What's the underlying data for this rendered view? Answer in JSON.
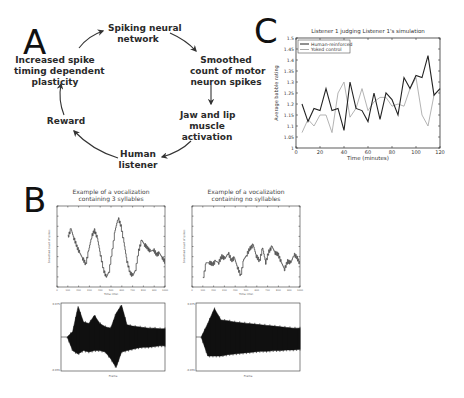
{
  "panels": {
    "a": {
      "letter": "A",
      "nodes": [
        {
          "id": "network",
          "lines": [
            "Spiking neural",
            "network"
          ]
        },
        {
          "id": "smoothed",
          "lines": [
            "Smoothed",
            "count of motor",
            "neuron spikes"
          ]
        },
        {
          "id": "jaw",
          "lines": [
            "Jaw and lip",
            "muscle",
            "activation"
          ]
        },
        {
          "id": "listener",
          "lines": [
            "Human",
            "listener"
          ]
        },
        {
          "id": "reward",
          "lines": [
            "Reward"
          ]
        },
        {
          "id": "stdp",
          "lines": [
            "Increased spike",
            "timing dependent",
            "plasticity"
          ]
        }
      ]
    },
    "b": {
      "letter": "B",
      "plot1_title": [
        "Example of a vocalization",
        "containing 3 syllables"
      ],
      "plot2_title": [
        "Example of a vocalization",
        "containing no syllables"
      ],
      "top_xlabel": "Time (ms)",
      "top_ylabel": "Smoothed count of spikes",
      "wave_xlabel": "Frame"
    },
    "c": {
      "letter": "C"
    }
  },
  "chart_data": [
    {
      "type": "line",
      "title": "Listener 1 judging Listener 1's simulation",
      "xlabel": "Time (minutes)",
      "ylabel": "Average babble rating",
      "xlim": [
        0,
        120
      ],
      "ylim": [
        1,
        1.5
      ],
      "xticks": [
        0,
        20,
        40,
        60,
        80,
        100,
        120
      ],
      "yticks": [
        1,
        1.05,
        1.1,
        1.15,
        1.2,
        1.25,
        1.3,
        1.35,
        1.4,
        1.45,
        1.5
      ],
      "legend_position": "upper left",
      "grid": false,
      "x": [
        5,
        10,
        15,
        20,
        25,
        30,
        35,
        40,
        45,
        50,
        55,
        60,
        65,
        70,
        75,
        80,
        85,
        90,
        95,
        100,
        105,
        110,
        115,
        120
      ],
      "series": [
        {
          "name": "Human-reinforced",
          "color": "#222222",
          "values": [
            1.2,
            1.12,
            1.18,
            1.17,
            1.27,
            1.17,
            1.18,
            1.08,
            1.3,
            1.18,
            1.17,
            1.12,
            1.25,
            1.13,
            1.25,
            1.22,
            1.15,
            1.32,
            1.27,
            1.33,
            1.32,
            1.42,
            1.24,
            1.27
          ]
        },
        {
          "name": "Yoked control",
          "color": "#aaaaaa",
          "values": [
            1.07,
            1.13,
            1.1,
            1.15,
            1.15,
            1.07,
            1.25,
            1.3,
            1.14,
            1.18,
            1.27,
            1.17,
            1.21,
            1.23,
            1.23,
            1.19,
            1.2,
            1.19,
            1.27,
            1.32,
            1.15,
            1.1,
            1.24,
            null
          ]
        }
      ]
    },
    {
      "type": "line",
      "title": "Example of a vocalization containing 3 syllables",
      "xlabel": "Time (ms)",
      "ylabel": "Smoothed count of spikes",
      "description": "Three large oscillation peaks with noisy step-like trace",
      "values_norm": [
        0.62,
        0.72,
        0.6,
        0.5,
        0.42,
        0.35,
        0.28,
        0.45,
        0.62,
        0.7,
        0.6,
        0.4,
        0.22,
        0.12,
        0.2,
        0.45,
        0.7,
        0.85,
        0.75,
        0.55,
        0.32,
        0.18,
        0.14,
        0.22,
        0.45,
        0.58,
        0.52,
        0.48,
        0.44,
        0.46,
        0.4,
        0.42,
        0.36,
        0.3
      ]
    },
    {
      "type": "line",
      "title": "Example of a vocalization containing no syllables",
      "xlabel": "Time (ms)",
      "ylabel": "Smoothed count of spikes",
      "description": "Low-amplitude noisy trace without large peaks",
      "values_norm": [
        0.1,
        0.3,
        0.3,
        0.28,
        0.32,
        0.3,
        0.38,
        0.35,
        0.42,
        0.33,
        0.36,
        0.24,
        0.14,
        0.34,
        0.4,
        0.48,
        0.52,
        0.38,
        0.32,
        0.48,
        0.3,
        0.44,
        0.5,
        0.42,
        0.4,
        0.3,
        0.22,
        0.32,
        0.3,
        0.4,
        0.36,
        0.28
      ]
    },
    {
      "type": "area",
      "title": "Waveform (3 syllables)",
      "xlabel": "Frame",
      "envelope_top": [
        0.5,
        0.58,
        0.95,
        0.72,
        0.7,
        0.82,
        0.7,
        0.65,
        0.63,
        0.85,
        0.97,
        0.68,
        0.66,
        0.65,
        0.64,
        0.63,
        0.63,
        0.62,
        0.62
      ],
      "envelope_bottom": [
        0.5,
        0.3,
        0.25,
        0.3,
        0.28,
        0.3,
        0.3,
        0.28,
        0.18,
        0.05,
        0.28,
        0.3,
        0.32,
        0.34,
        0.35,
        0.35,
        0.36,
        0.37,
        0.37
      ]
    },
    {
      "type": "area",
      "title": "Waveform (no syllables)",
      "xlabel": "Frame",
      "envelope_top": [
        0.5,
        0.7,
        0.92,
        0.75,
        0.74,
        0.72,
        0.71,
        0.7,
        0.69,
        0.68,
        0.67,
        0.66,
        0.65,
        0.64,
        0.63,
        0.63
      ],
      "envelope_bottom": [
        0.5,
        0.22,
        0.22,
        0.22,
        0.24,
        0.25,
        0.26,
        0.27,
        0.28,
        0.29,
        0.29,
        0.3,
        0.3,
        0.31,
        0.31,
        0.32
      ]
    }
  ]
}
